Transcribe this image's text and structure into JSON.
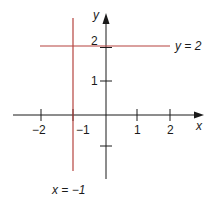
{
  "diagram": {
    "axes": {
      "x_label": "x",
      "y_label": "y",
      "x_ticks": [
        {
          "value": -2,
          "label": "−2"
        },
        {
          "value": -1,
          "label": "−1"
        },
        {
          "value": 1,
          "label": "1"
        },
        {
          "value": 2,
          "label": "2"
        }
      ],
      "y_ticks": [
        {
          "value": 1,
          "label": "1"
        },
        {
          "value": 2,
          "label": "2"
        },
        {
          "value": -1,
          "label": ""
        }
      ]
    },
    "lines": [
      {
        "equation": "y = 2",
        "label": "y = 2",
        "orientation": "horizontal",
        "value": 2,
        "color": "#b5433f"
      },
      {
        "equation": "x = −1",
        "label": "x = −1",
        "orientation": "vertical",
        "value": -1,
        "color": "#b5433f"
      }
    ],
    "labels": {
      "y_eq_2": "y = 2",
      "x_eq_neg1": "x = −1",
      "tick_x_neg2": "−2",
      "tick_x_neg1": "−1",
      "tick_x_1": "1",
      "tick_x_2": "2",
      "tick_y_1": "1",
      "tick_y_2": "2"
    },
    "colors": {
      "axis": "#1a1a1a",
      "graph_line": "#b5433f"
    }
  }
}
